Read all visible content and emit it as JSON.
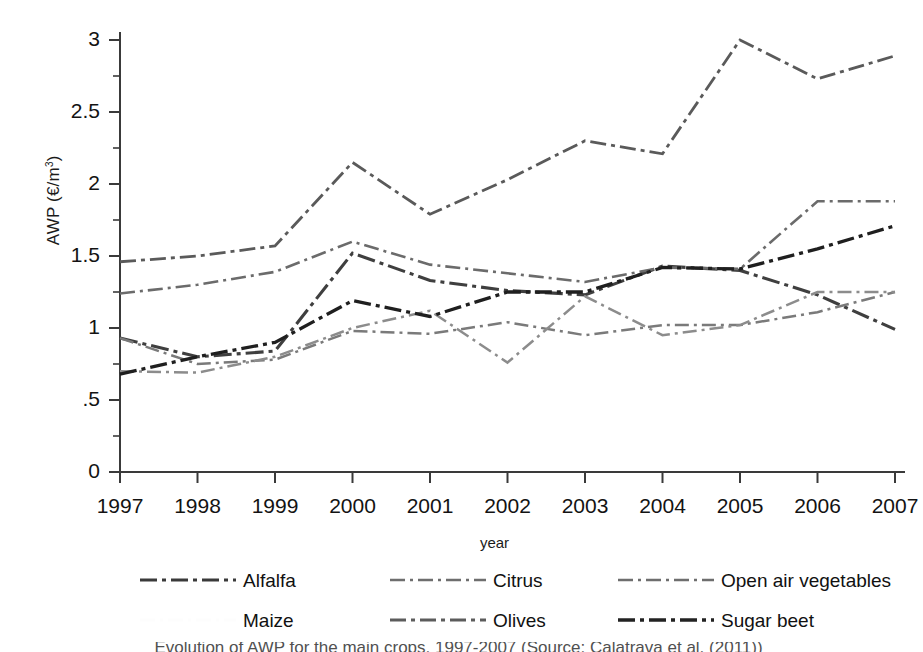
{
  "chart_data": {
    "type": "line",
    "title": "",
    "xlabel": "year",
    "ylabel": "AWP (€/m³)",
    "ylabel_base": "AWP (€/m",
    "ylabel_sup": "3",
    "ylabel_tail": ")",
    "x": [
      1997,
      1998,
      1999,
      2000,
      2001,
      2002,
      2003,
      2004,
      2005,
      2006,
      2007
    ],
    "categories": [
      "1997",
      "1998",
      "1999",
      "2000",
      "2001",
      "2002",
      "2003",
      "2004",
      "2005",
      "2006",
      "2007"
    ],
    "xlim": [
      1997,
      2007
    ],
    "ylim": [
      0,
      3
    ],
    "yticks": [
      0,
      0.5,
      1,
      1.5,
      2,
      2.5,
      3
    ],
    "ytick_labels": [
      "0",
      ".5",
      "1",
      "1.5",
      "2",
      "2.5",
      "3"
    ],
    "minor_yticks": [
      0.25,
      0.75,
      1.25,
      1.75,
      2.25,
      2.75
    ],
    "grid": false,
    "legend_position": "below",
    "series": [
      {
        "name": "Alfalfa",
        "dash": "18,5,4,5",
        "width": 3.1,
        "color": "#3f3f3f",
        "values": [
          0.93,
          0.8,
          0.84,
          1.52,
          1.33,
          1.26,
          1.23,
          1.43,
          1.4,
          1.23,
          0.99
        ]
      },
      {
        "name": "Citrus",
        "dash": "15,5,3,5",
        "width": 2.6,
        "color": "#6b6b6b",
        "values": [
          1.24,
          1.3,
          1.39,
          1.6,
          1.44,
          1.38,
          1.32,
          1.42,
          1.41,
          1.88,
          1.88
        ]
      },
      {
        "name": "Open air vegetables",
        "dash": "14,5,3,5",
        "width": 2.5,
        "color": "#7a7a7a",
        "values": [
          0.93,
          0.75,
          0.78,
          0.98,
          0.96,
          1.04,
          0.95,
          1.02,
          1.02,
          1.11,
          1.25
        ]
      },
      {
        "name": "Maize",
        "dash": "14,5,3,5",
        "width": 2.5,
        "color": "#8c8c8c",
        "values": [
          0.7,
          0.69,
          0.8,
          1.0,
          1.12,
          0.76,
          1.22,
          0.95,
          1.02,
          1.25,
          1.25
        ]
      },
      {
        "name": "Olives",
        "dash": "16,5,4,5",
        "width": 2.8,
        "color": "#5a5a5a",
        "values": [
          1.46,
          1.5,
          1.57,
          2.15,
          1.79,
          2.03,
          2.3,
          2.21,
          3.0,
          2.73,
          2.89
        ]
      },
      {
        "name": "Sugar beet",
        "dash": "17,5,4,5",
        "width": 3.3,
        "color": "#1f1f1f",
        "values": [
          0.68,
          0.8,
          0.9,
          1.19,
          1.08,
          1.25,
          1.25,
          1.42,
          1.41,
          1.55,
          1.71
        ]
      }
    ]
  },
  "axis": {
    "y_title": "AWP (€/m³)",
    "x_title": "year"
  },
  "legend": {
    "entries": [
      {
        "label": "Alfalfa",
        "swatch": "legend-dash-alfalfa",
        "dash": "17,5,4,5",
        "width": 3.2,
        "color": "#3a3a3a",
        "visible": true
      },
      {
        "label": "Citrus",
        "swatch": "legend-dash-citrus",
        "dash": "15,5,3,5",
        "width": 2.6,
        "color": "#6e6e6e",
        "visible": true
      },
      {
        "label": "Open air vegetables",
        "swatch": "legend-dash-openair",
        "dash": "15,5,3,5",
        "width": 2.6,
        "color": "#6e6e6e",
        "visible": true
      },
      {
        "label": "Maize",
        "swatch": "legend-dash-maize",
        "dash": "15,5,3,5",
        "width": 2.6,
        "color": "#f2f2f2",
        "visible": false
      },
      {
        "label": "Olives",
        "swatch": "legend-dash-olives",
        "dash": "16,5,4,5",
        "width": 2.8,
        "color": "#5c5c5c",
        "visible": true
      },
      {
        "label": "Sugar beet",
        "swatch": "legend-dash-sugarbeet",
        "dash": "17,5,4,5",
        "width": 3.3,
        "color": "#222222",
        "visible": true
      }
    ]
  },
  "caption": {
    "text": "Evolution of AWP for the main crops, 1997-2007 (Source: Calatrava et al. (2011))"
  }
}
